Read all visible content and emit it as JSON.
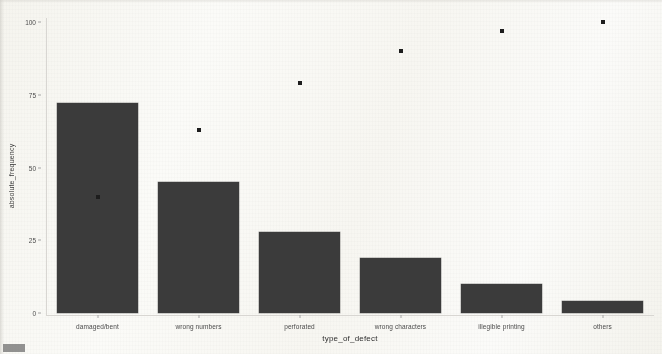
{
  "chart_data": {
    "type": "bar",
    "title": "",
    "subtitle": "",
    "xlabel": "type_of_defect",
    "ylabel": "absolute_frequency",
    "categories": [
      "damaged/bent",
      "wrong numbers",
      "perforated",
      "wrong characters",
      "illegible printing",
      "others"
    ],
    "values": [
      72,
      45,
      28,
      19,
      10,
      4
    ],
    "series": [
      {
        "name": "absolute_frequency",
        "type": "bar",
        "values": [
          72,
          45,
          28,
          19,
          10,
          4
        ]
      },
      {
        "name": "cumulative_percentage",
        "type": "scatter",
        "values": [
          40,
          63,
          79,
          90,
          97,
          100
        ]
      }
    ],
    "ylim": [
      0,
      100
    ],
    "yticks": [
      0,
      25,
      50,
      75,
      100
    ],
    "ytick_labels": [
      "0",
      "25",
      "50",
      "75",
      "100"
    ],
    "grid": false,
    "legend": "none",
    "bar_color": "#3b3b3b",
    "point_color": "#1d1d1d",
    "background_color": "#fdfdfb"
  },
  "axes": {
    "y_title": "absolute_frequency",
    "x_title": "type_of_defect"
  }
}
